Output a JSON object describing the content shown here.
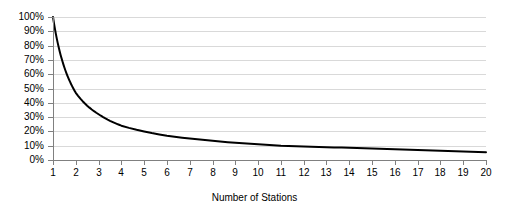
{
  "chart_data": {
    "type": "line",
    "title": "",
    "xlabel": "Number of Stations",
    "ylabel": "",
    "x": [
      1,
      2,
      3,
      4,
      5,
      6,
      7,
      8,
      9,
      10,
      11,
      12,
      13,
      14,
      15,
      16,
      17,
      18,
      19,
      20
    ],
    "series": [
      {
        "name": "Share per station",
        "values": [
          100,
          47,
          32,
          24,
          20,
          17,
          15,
          13.5,
          12,
          11,
          10,
          9.5,
          9,
          8.5,
          8,
          7.5,
          7,
          6.5,
          6,
          5.5
        ]
      }
    ],
    "xlim": [
      1,
      20
    ],
    "ylim": [
      0,
      100
    ],
    "xtick_labels": [
      "1",
      "2",
      "3",
      "4",
      "5",
      "6",
      "7",
      "8",
      "9",
      "10",
      "11",
      "12",
      "13",
      "14",
      "15",
      "16",
      "17",
      "18",
      "19",
      "20"
    ],
    "ytick_values": [
      0,
      10,
      20,
      30,
      40,
      50,
      60,
      70,
      80,
      90,
      100
    ],
    "ytick_labels": [
      "0%",
      "10%",
      "20%",
      "30%",
      "40%",
      "50%",
      "60%",
      "70%",
      "80%",
      "90%",
      "100%"
    ],
    "grid": "horizontal",
    "legend": "none",
    "line_color": "#000000",
    "gridline_color": "#d9d9d9",
    "axis_color": "#808080",
    "background_color": "#ffffff"
  }
}
